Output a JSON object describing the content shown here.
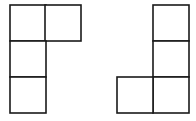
{
  "diagram": {
    "stroke_color": "#1a1a1a",
    "fill_color": "#ffffff",
    "cell_size": 36,
    "shapes": [
      {
        "name": "left-L-tetromino",
        "cells": [
          {
            "x": 10,
            "y": 5
          },
          {
            "x": 45,
            "y": 5
          },
          {
            "x": 10,
            "y": 41
          },
          {
            "x": 10,
            "y": 77
          }
        ]
      },
      {
        "name": "right-J-tetromino",
        "cells": [
          {
            "x": 153,
            "y": 5
          },
          {
            "x": 153,
            "y": 41
          },
          {
            "x": 153,
            "y": 77
          },
          {
            "x": 117,
            "y": 77
          }
        ]
      }
    ]
  }
}
